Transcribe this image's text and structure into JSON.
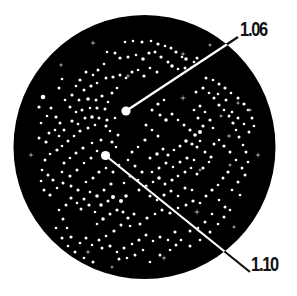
{
  "disc": {
    "cx": 144.5,
    "cy": 147,
    "rx": 131,
    "ry": 132,
    "fill": "#000000"
  },
  "colors": {
    "star": "#ffffff",
    "line": "#ffffff",
    "line_outside": "#111111",
    "label": "#111111"
  },
  "callouts": [
    {
      "label": "1.06",
      "star": {
        "x": 126,
        "y": 111,
        "r": 4.6
      },
      "line_end": {
        "x": 238,
        "y": 37
      },
      "label_pos": {
        "x": 240,
        "y": 19
      }
    },
    {
      "label": "1.10",
      "star": {
        "x": 105.5,
        "y": 155.5,
        "r": 4.6
      },
      "line_end": {
        "x": 250,
        "y": 272
      },
      "label_pos": {
        "x": 251,
        "y": 254
      }
    }
  ],
  "sparkles": [
    [
      93,
      43,
      3
    ],
    [
      61,
      65,
      2.5
    ],
    [
      183,
      54,
      3
    ],
    [
      210,
      45,
      2.5
    ],
    [
      183,
      98,
      3.5
    ],
    [
      221,
      116,
      2.5
    ],
    [
      229,
      136,
      3
    ],
    [
      258,
      155,
      3
    ],
    [
      31,
      155,
      3
    ],
    [
      88,
      252,
      3
    ],
    [
      164,
      258,
      3
    ],
    [
      197,
      212,
      3.5
    ],
    [
      234,
      227,
      2.5
    ],
    [
      250,
      110,
      2.5
    ],
    [
      230,
      165,
      2.5
    ],
    [
      238,
      103,
      2.5
    ],
    [
      128,
      76,
      2.5
    ],
    [
      112,
      267,
      2
    ],
    [
      200,
      170,
      2
    ]
  ],
  "stars": [
    [
      125,
      42,
      1.3
    ],
    [
      133,
      41,
      1.3
    ],
    [
      142,
      42,
      1.5
    ],
    [
      151,
      41,
      1.3
    ],
    [
      158,
      44,
      1.6
    ],
    [
      165,
      46,
      1.3
    ],
    [
      171,
      48,
      1.5
    ],
    [
      176,
      52,
      1.6
    ],
    [
      182,
      57,
      1.3
    ],
    [
      186,
      59,
      1.8
    ],
    [
      194,
      62,
      1.3
    ],
    [
      197,
      58,
      1.5
    ],
    [
      107,
      52,
      1.3
    ],
    [
      115,
      53,
      1.5
    ],
    [
      120,
      58,
      1.6
    ],
    [
      128,
      57,
      1.5
    ],
    [
      136,
      55,
      1.3
    ],
    [
      143,
      59,
      1.8
    ],
    [
      149,
      53,
      1.6
    ],
    [
      155,
      52,
      1.5
    ],
    [
      161,
      57,
      1.6
    ],
    [
      168,
      62,
      1.5
    ],
    [
      172,
      66,
      1.8
    ],
    [
      178,
      69,
      1.3
    ],
    [
      185,
      68,
      1.5
    ],
    [
      192,
      67,
      1.3
    ],
    [
      104,
      64,
      1.3
    ],
    [
      98,
      70,
      1.5
    ],
    [
      93,
      75,
      1.3
    ],
    [
      86,
      72,
      1.5
    ],
    [
      80,
      80,
      1.6
    ],
    [
      76,
      86,
      1.3
    ],
    [
      84,
      90,
      1.5
    ],
    [
      91,
      86,
      1.6
    ],
    [
      97,
      83,
      1.3
    ],
    [
      106,
      78,
      1.5
    ],
    [
      113,
      77,
      1.6
    ],
    [
      120,
      75,
      1.5
    ],
    [
      126,
      78,
      1.3
    ],
    [
      132,
      72,
      1.5
    ],
    [
      138,
      70,
      1.3
    ],
    [
      144,
      76,
      1.6
    ],
    [
      150,
      68,
      1.3
    ],
    [
      157,
      72,
      1.5
    ],
    [
      62,
      79,
      1.3
    ],
    [
      59,
      88,
      1.5
    ],
    [
      72,
      95,
      1.6
    ],
    [
      79,
      100,
      1.5
    ],
    [
      88,
      99,
      1.8
    ],
    [
      96,
      100,
      1.5
    ],
    [
      102,
      96,
      1.6
    ],
    [
      108,
      102,
      1.3
    ],
    [
      112,
      93,
      1.5
    ],
    [
      117,
      88,
      1.3
    ],
    [
      97,
      108,
      1.6
    ],
    [
      105,
      109,
      1.5
    ],
    [
      90,
      108,
      1.3
    ],
    [
      82,
      110,
      1.5
    ],
    [
      76,
      112,
      1.3
    ],
    [
      70,
      107,
      1.5
    ],
    [
      65,
      100,
      1.3
    ],
    [
      43,
      97,
      2.3
    ],
    [
      39,
      107,
      1.6
    ],
    [
      51,
      108,
      1.5
    ],
    [
      47,
      116,
      1.3
    ],
    [
      56,
      117,
      1.6
    ],
    [
      60,
      123,
      1.5
    ],
    [
      55,
      130,
      1.3
    ],
    [
      49,
      133,
      1.5
    ],
    [
      41,
      123,
      1.3
    ],
    [
      39,
      138,
      1.5
    ],
    [
      46,
      142,
      1.6
    ],
    [
      59,
      136,
      1.3
    ],
    [
      64,
      130,
      1.5
    ],
    [
      72,
      121,
      1.6
    ],
    [
      78,
      124,
      1.3
    ],
    [
      85,
      118,
      1.5
    ],
    [
      92,
      117,
      1.8
    ],
    [
      99,
      118,
      1.5
    ],
    [
      107,
      120,
      1.6
    ],
    [
      115,
      118,
      1.3
    ],
    [
      106,
      126,
      1.5
    ],
    [
      95,
      125,
      1.3
    ],
    [
      88,
      128,
      1.5
    ],
    [
      80,
      131,
      1.6
    ],
    [
      74,
      136,
      1.3
    ],
    [
      68,
      141,
      1.5
    ],
    [
      62,
      146,
      1.3
    ],
    [
      57,
      150,
      1.6
    ],
    [
      50,
      154,
      1.3
    ],
    [
      45,
      160,
      1.5
    ],
    [
      42,
      170,
      1.3
    ],
    [
      48,
      175,
      1.5
    ],
    [
      53,
      180,
      1.6
    ],
    [
      41,
      181,
      1.3
    ],
    [
      44,
      190,
      1.5
    ],
    [
      50,
      195,
      1.6
    ],
    [
      57,
      188,
      1.3
    ],
    [
      63,
      183,
      1.5
    ],
    [
      70,
      176,
      1.6
    ],
    [
      77,
      170,
      1.5
    ],
    [
      84,
      163,
      1.3
    ],
    [
      91,
      158,
      1.5
    ],
    [
      97,
      151,
      1.3
    ],
    [
      112,
      142,
      1.6
    ],
    [
      116,
      147,
      1.3
    ],
    [
      118,
      135,
      1.5
    ],
    [
      110,
      131,
      1.3
    ],
    [
      101,
      140,
      1.5
    ],
    [
      92,
      143,
      1.3
    ],
    [
      83,
      148,
      1.6
    ],
    [
      76,
      153,
      1.5
    ],
    [
      70,
      158,
      1.3
    ],
    [
      64,
      163,
      1.5
    ],
    [
      62,
      172,
      1.3
    ],
    [
      71,
      186,
      1.5
    ],
    [
      78,
      190,
      1.6
    ],
    [
      86,
      182,
      1.3
    ],
    [
      93,
      178,
      1.5
    ],
    [
      99,
      172,
      1.6
    ],
    [
      106,
      168,
      1.3
    ],
    [
      113,
      172,
      1.5
    ],
    [
      119,
      165,
      1.3
    ],
    [
      111,
      184,
      1.6
    ],
    [
      104,
      190,
      1.5
    ],
    [
      97,
      196,
      1.8
    ],
    [
      90,
      192,
      1.3
    ],
    [
      84,
      199,
      1.5
    ],
    [
      77,
      203,
      1.3
    ],
    [
      71,
      198,
      1.6
    ],
    [
      66,
      205,
      1.5
    ],
    [
      59,
      210,
      1.3
    ],
    [
      63,
      219,
      1.5
    ],
    [
      67,
      228,
      1.3
    ],
    [
      71,
      237,
      1.6
    ],
    [
      81,
      209,
      1.5
    ],
    [
      89,
      205,
      1.6
    ],
    [
      95,
      212,
      1.3
    ],
    [
      101,
      205,
      1.8
    ],
    [
      108,
      201,
      1.5
    ],
    [
      113,
      197,
      2
    ],
    [
      121,
      201,
      2
    ],
    [
      126,
      196,
      1.8
    ],
    [
      117,
      210,
      1.6
    ],
    [
      110,
      214,
      1.5
    ],
    [
      103,
      219,
      1.8
    ],
    [
      97,
      224,
      1.3
    ],
    [
      123,
      212,
      1.5
    ],
    [
      128,
      218,
      1.6
    ],
    [
      134,
      214,
      1.5
    ],
    [
      130,
      226,
      1.3
    ],
    [
      121,
      225,
      1.5
    ],
    [
      114,
      231,
      1.6
    ],
    [
      106,
      236,
      1.3
    ],
    [
      99,
      240,
      1.5
    ],
    [
      92,
      245,
      1.3
    ],
    [
      86,
      238,
      1.5
    ],
    [
      80,
      243,
      1.3
    ],
    [
      102,
      248,
      1.5
    ],
    [
      110,
      246,
      1.6
    ],
    [
      117,
      252,
      1.3
    ],
    [
      124,
      248,
      1.5
    ],
    [
      132,
      244,
      1.3
    ],
    [
      139,
      240,
      1.6
    ],
    [
      146,
      235,
      1.5
    ],
    [
      153,
      241,
      1.3
    ],
    [
      160,
      237,
      1.5
    ],
    [
      168,
      240,
      1.3
    ],
    [
      176,
      245,
      1.5
    ],
    [
      181,
      240,
      1.3
    ],
    [
      175,
      232,
      1.6
    ],
    [
      143,
      250,
      1.3
    ],
    [
      135,
      255,
      1.5
    ],
    [
      127,
      258,
      1.3
    ],
    [
      119,
      259,
      1.5
    ],
    [
      140,
      224,
      1.5
    ],
    [
      147,
      218,
      1.6
    ],
    [
      155,
      214,
      1.3
    ],
    [
      162,
      210,
      1.5
    ],
    [
      170,
      213,
      1.6
    ],
    [
      178,
      208,
      1.3
    ],
    [
      186,
      205,
      1.5
    ],
    [
      193,
      201,
      1.6
    ],
    [
      200,
      203,
      1.3
    ],
    [
      206,
      196,
      1.5
    ],
    [
      212,
      190,
      1.6
    ],
    [
      218,
      185,
      1.3
    ],
    [
      223,
      178,
      1.5
    ],
    [
      228,
      172,
      1.6
    ],
    [
      219,
      200,
      1.3
    ],
    [
      225,
      207,
      1.5
    ],
    [
      212,
      214,
      1.3
    ],
    [
      205,
      222,
      1.5
    ],
    [
      198,
      228,
      1.3
    ],
    [
      190,
      231,
      1.5
    ],
    [
      232,
      190,
      1.3
    ],
    [
      238,
      182,
      1.5
    ],
    [
      240,
      195,
      1.3
    ],
    [
      245,
      175,
      1.5
    ],
    [
      139,
      190,
      1.5
    ],
    [
      146,
      186,
      1.6
    ],
    [
      153,
      182,
      1.3
    ],
    [
      159,
      178,
      1.8
    ],
    [
      165,
      184,
      1.5
    ],
    [
      172,
      180,
      1.6
    ],
    [
      178,
      176,
      1.3
    ],
    [
      185,
      172,
      1.5
    ],
    [
      191,
      168,
      1.3
    ],
    [
      197,
      174,
      1.5
    ],
    [
      203,
      168,
      1.6
    ],
    [
      209,
      162,
      1.3
    ],
    [
      150,
      196,
      1.5
    ],
    [
      157,
      200,
      1.3
    ],
    [
      164,
      195,
      1.6
    ],
    [
      171,
      191,
      1.5
    ],
    [
      178,
      196,
      1.3
    ],
    [
      185,
      188,
      1.5
    ],
    [
      192,
      190,
      1.3
    ],
    [
      150,
      158,
      1.5
    ],
    [
      157,
      154,
      1.8
    ],
    [
      163,
      149,
      1.5
    ],
    [
      168,
      155,
      1.6
    ],
    [
      174,
      150,
      1.3
    ],
    [
      180,
      146,
      1.5
    ],
    [
      186,
      141,
      1.8
    ],
    [
      192,
      144,
      1.6
    ],
    [
      197,
      147,
      1.5
    ],
    [
      200,
      141,
      1.3
    ],
    [
      205,
      152,
      1.5
    ],
    [
      211,
      157,
      1.6
    ],
    [
      166,
      163,
      1.5
    ],
    [
      173,
      167,
      1.3
    ],
    [
      180,
      162,
      1.5
    ],
    [
      187,
      158,
      1.6
    ],
    [
      194,
      160,
      1.3
    ],
    [
      159,
      168,
      1.5
    ],
    [
      152,
      172,
      1.3
    ],
    [
      152,
      110,
      1.5
    ],
    [
      158,
      104,
      1.6
    ],
    [
      164,
      100,
      1.3
    ],
    [
      160,
      115,
      1.5
    ],
    [
      166,
      120,
      1.8
    ],
    [
      172,
      114,
      1.5
    ],
    [
      178,
      120,
      1.3
    ],
    [
      184,
      125,
      1.5
    ],
    [
      190,
      130,
      1.6
    ],
    [
      195,
      135,
      1.8
    ],
    [
      200,
      132,
      2
    ],
    [
      203,
      126,
      1.6
    ],
    [
      198,
      118,
      1.5
    ],
    [
      194,
      110,
      1.3
    ],
    [
      200,
      106,
      1.5
    ],
    [
      205,
      112,
      1.3
    ],
    [
      210,
      120,
      1.6
    ],
    [
      213,
      128,
      1.3
    ],
    [
      196,
      92,
      1.5
    ],
    [
      203,
      88,
      1.6
    ],
    [
      209,
      93,
      1.3
    ],
    [
      214,
      98,
      1.5
    ],
    [
      219,
      105,
      1.6
    ],
    [
      224,
      110,
      1.3
    ],
    [
      229,
      116,
      1.5
    ],
    [
      233,
      123,
      1.6
    ],
    [
      236,
      130,
      1.3
    ],
    [
      239,
      137,
      1.5
    ],
    [
      243,
      145,
      1.3
    ],
    [
      246,
      152,
      1.5
    ],
    [
      248,
      162,
      1.3
    ],
    [
      242,
      168,
      1.5
    ],
    [
      236,
      160,
      1.3
    ],
    [
      230,
      152,
      1.5
    ],
    [
      224,
      146,
      1.6
    ],
    [
      219,
      140,
      1.3
    ],
    [
      214,
      144,
      1.5
    ],
    [
      206,
      78,
      1.5
    ],
    [
      213,
      80,
      1.3
    ],
    [
      219,
      84,
      1.5
    ],
    [
      225,
      88,
      1.6
    ],
    [
      231,
      93,
      1.3
    ],
    [
      238,
      98,
      1.5
    ],
    [
      244,
      104,
      1.6
    ],
    [
      248,
      110,
      1.3
    ],
    [
      252,
      118,
      1.5
    ],
    [
      254,
      126,
      1.3
    ],
    [
      249,
      132,
      1.5
    ],
    [
      244,
      124,
      1.3
    ],
    [
      238,
      118,
      1.5
    ],
    [
      232,
      112,
      1.3
    ],
    [
      226,
      100,
      1.5
    ],
    [
      218,
      94,
      1.3
    ],
    [
      146,
      125,
      1.5
    ],
    [
      152,
      130,
      1.3
    ],
    [
      158,
      136,
      1.5
    ],
    [
      145,
      140,
      1.6
    ],
    [
      138,
      147,
      1.3
    ],
    [
      132,
      152,
      1.5
    ],
    [
      128,
      160,
      1.3
    ],
    [
      135,
      166,
      1.5
    ],
    [
      142,
      172,
      1.6
    ],
    [
      138,
      180,
      1.3
    ],
    [
      130,
      176,
      1.5
    ],
    [
      124,
      183,
      1.3
    ],
    [
      56,
      228,
      1.3
    ],
    [
      62,
      238,
      1.5
    ],
    [
      68,
      246,
      1.3
    ],
    [
      75,
      252,
      1.5
    ],
    [
      84,
      258,
      1.3
    ],
    [
      93,
      262,
      1.5
    ],
    [
      150,
      262,
      1.3
    ],
    [
      160,
      255,
      1.5
    ],
    [
      170,
      250,
      1.3
    ],
    [
      190,
      246,
      1.5
    ],
    [
      200,
      240,
      1.3
    ],
    [
      210,
      232,
      1.5
    ],
    [
      218,
      224,
      1.3
    ],
    [
      224,
      217,
      1.5
    ],
    [
      230,
      210,
      1.3
    ]
  ]
}
